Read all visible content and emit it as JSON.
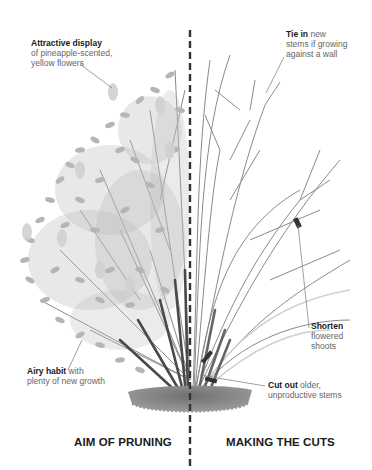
{
  "diagram": {
    "type": "pruning-illustration",
    "divider": "dashed-vertical-line",
    "palette": {
      "text_dark": "#1a1a1a",
      "text_light": "#666666",
      "foliage": "#b3b3b3",
      "stems": "#555555",
      "soil": "#7a7a7a"
    }
  },
  "annotations": {
    "attractive_display": {
      "bold": "Attractive display",
      "line1": "of pineapple-scented,",
      "line2": "yellow flowers"
    },
    "tie_in": {
      "bold": "Tie in",
      "rest1": " new",
      "line2": "stems if growing",
      "line3": "against a wall"
    },
    "shorten": {
      "bold": "Shorten",
      "line2": "flowered",
      "line3": "shoots"
    },
    "cut_out": {
      "bold": "Cut out",
      "rest1": " older,",
      "line2": "unproductive stems"
    },
    "airy_habit": {
      "bold": "Airy habit",
      "rest1": " with",
      "line2": "plenty of new growth"
    }
  },
  "captions": {
    "left": "AIM OF PRUNING",
    "right": "MAKING THE CUTS"
  }
}
